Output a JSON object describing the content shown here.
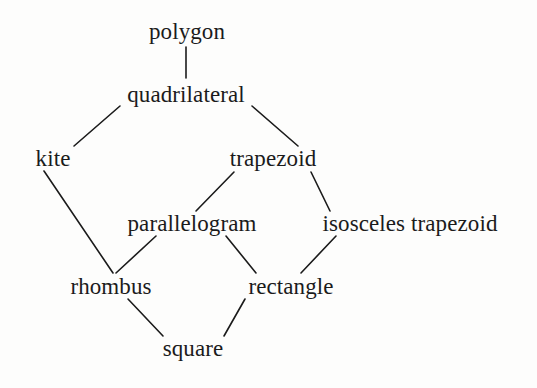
{
  "diagram": {
    "background_color": "#fdfdfc",
    "line_color": "#1b1b1b",
    "text_color": "#1b1b1b",
    "nodes": [
      {
        "id": "polygon",
        "label": "polygon",
        "x": 187,
        "y": 31
      },
      {
        "id": "quadrilateral",
        "label": "quadrilateral",
        "x": 186,
        "y": 94
      },
      {
        "id": "kite",
        "label": "kite",
        "x": 53,
        "y": 158
      },
      {
        "id": "trapezoid",
        "label": "trapezoid",
        "x": 273,
        "y": 158
      },
      {
        "id": "parallelogram",
        "label": "parallelogram",
        "x": 192,
        "y": 223
      },
      {
        "id": "isosceles_trapezoid",
        "label": "isosceles trapezoid",
        "x": 410,
        "y": 223
      },
      {
        "id": "rhombus",
        "label": "rhombus",
        "x": 111,
        "y": 286
      },
      {
        "id": "rectangle",
        "label": "rectangle",
        "x": 291,
        "y": 286
      },
      {
        "id": "square",
        "label": "square",
        "x": 193,
        "y": 348
      }
    ],
    "edges": [
      {
        "from": "polygon",
        "to": "quadrilateral",
        "x1": 186,
        "y1": 47,
        "x2": 186,
        "y2": 78
      },
      {
        "from": "quadrilateral",
        "to": "kite",
        "x1": 120,
        "y1": 106,
        "x2": 74,
        "y2": 146
      },
      {
        "from": "quadrilateral",
        "to": "trapezoid",
        "x1": 252,
        "y1": 106,
        "x2": 298,
        "y2": 146
      },
      {
        "from": "kite",
        "to": "rhombus",
        "x1": 44,
        "y1": 171,
        "x2": 113,
        "y2": 273
      },
      {
        "from": "trapezoid",
        "to": "parallelogram",
        "x1": 234,
        "y1": 172,
        "x2": 196,
        "y2": 211
      },
      {
        "from": "trapezoid",
        "to": "isosceles_trapezoid",
        "x1": 311,
        "y1": 172,
        "x2": 330,
        "y2": 211
      },
      {
        "from": "parallelogram",
        "to": "rhombus",
        "x1": 156,
        "y1": 236,
        "x2": 116,
        "y2": 273
      },
      {
        "from": "parallelogram",
        "to": "rectangle",
        "x1": 226,
        "y1": 236,
        "x2": 256,
        "y2": 273
      },
      {
        "from": "isosceles_trapezoid",
        "to": "rectangle",
        "x1": 336,
        "y1": 236,
        "x2": 301,
        "y2": 273
      },
      {
        "from": "rhombus",
        "to": "square",
        "x1": 128,
        "y1": 299,
        "x2": 163,
        "y2": 336
      },
      {
        "from": "rectangle",
        "to": "square",
        "x1": 245,
        "y1": 299,
        "x2": 224,
        "y2": 336
      }
    ]
  }
}
